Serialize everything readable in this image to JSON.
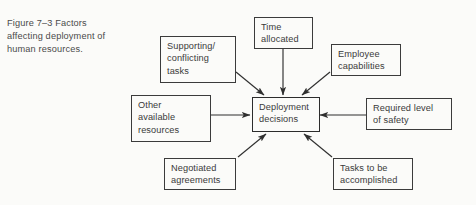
{
  "figure": {
    "caption": "Figure 7–3   Factors\naffecting deployment of\nhuman resources.",
    "caption_label": "Figure 7–3",
    "caption_text": "Factors affecting deployment of human resources."
  },
  "diagram": {
    "type": "hub-and-spoke",
    "center": {
      "id": "deployment-decisions",
      "label": "Deployment\ndecisions"
    },
    "factors": [
      {
        "id": "supporting-conflicting-tasks",
        "label": "Supporting/\nconflicting\ntasks",
        "position": "top-left"
      },
      {
        "id": "time-allocated",
        "label": "Time\nallocated",
        "position": "top"
      },
      {
        "id": "employee-capabilities",
        "label": "Employee\ncapabilities",
        "position": "top-right"
      },
      {
        "id": "other-available-resources",
        "label": "Other\navailable\nresources",
        "position": "left"
      },
      {
        "id": "required-level-of-safety",
        "label": "Required level\nof safety",
        "position": "right"
      },
      {
        "id": "negotiated-agreements",
        "label": "Negotiated\nagreements",
        "position": "bottom-left"
      },
      {
        "id": "tasks-to-be-accomplished",
        "label": "Tasks to be\naccomplished",
        "position": "bottom-right"
      }
    ],
    "arrow_count": 7,
    "arrow_direction": "factors-to-center",
    "colors": {
      "stroke": "#3b3b3b",
      "text": "#3a3a3a",
      "background": "#fbfbf9"
    }
  }
}
